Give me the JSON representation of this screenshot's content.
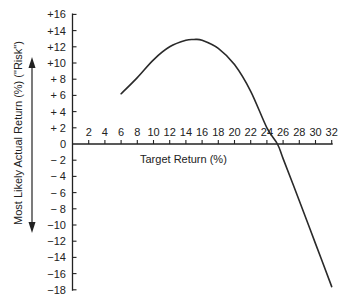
{
  "chart_data": {
    "type": "line",
    "title": "",
    "xlabel": "Target Return (%)",
    "ylabel": "Most Likely Actual Return (%) (\"Risk\")",
    "x_ticks": [
      "2",
      "4",
      "6",
      "8",
      "10",
      "12",
      "14",
      "16",
      "18",
      "20",
      "22",
      "24",
      "26",
      "28",
      "30",
      "32"
    ],
    "y_ticks": [
      "+16",
      "+14",
      "+12",
      "+10",
      "+ 8",
      "+ 6",
      "+ 4",
      "+ 2",
      "0",
      "− 2",
      "− 4",
      "− 6",
      "− 8",
      "−10",
      "−12",
      "−14",
      "−16",
      "−18"
    ],
    "xlim": [
      0,
      32
    ],
    "ylim": [
      -18,
      16
    ],
    "grid": false,
    "legend": null,
    "series": [
      {
        "name": "Most Likely Actual Return",
        "x": [
          6,
          8,
          10,
          12,
          14,
          15,
          16,
          18,
          20,
          22,
          24,
          25.3,
          26,
          28,
          30,
          32
        ],
        "y": [
          6.2,
          8.2,
          10.4,
          12.0,
          12.8,
          12.9,
          12.8,
          11.8,
          9.8,
          6.5,
          2.0,
          0,
          -1.8,
          -7.0,
          -12.3,
          -17.6
        ]
      }
    ],
    "annotations": [
      "double-headed vertical arrow beside y-axis label"
    ]
  }
}
